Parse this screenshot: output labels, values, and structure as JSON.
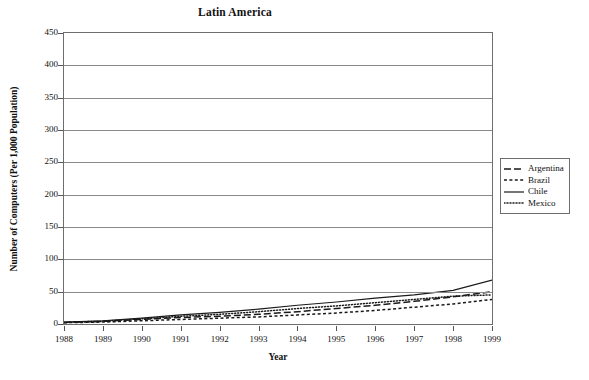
{
  "chart_data": {
    "type": "line",
    "title": "Latin America",
    "xlabel": "Year",
    "ylabel": "Number of Computers (Per 1,000 Population)",
    "categories": [
      1988,
      1989,
      1990,
      1991,
      1992,
      1993,
      1994,
      1995,
      1996,
      1997,
      1998,
      1999
    ],
    "x": [
      "1988",
      "1989",
      "1990",
      "1991",
      "1992",
      "1993",
      "1994",
      "1995",
      "1996",
      "1997",
      "1998",
      "1999"
    ],
    "ylim": [
      0,
      450
    ],
    "yticks": [
      "0",
      "50",
      "100",
      "150",
      "200",
      "250",
      "300",
      "350",
      "400",
      "450"
    ],
    "ytick_values": [
      0,
      50,
      100,
      150,
      200,
      250,
      300,
      350,
      400,
      450
    ],
    "grid": "horizontal",
    "legend_position": "right",
    "series": [
      {
        "name": "Argentina",
        "style": "dashed",
        "color": "#1a1a1a",
        "values": [
          2.5,
          4,
          7,
          10,
          12,
          15,
          19,
          24,
          29,
          35,
          42,
          50
        ]
      },
      {
        "name": "Brazil",
        "style": "short-dashed",
        "color": "#1a1a1a",
        "values": [
          2,
          3,
          5,
          7,
          9,
          11,
          14,
          17,
          21,
          26,
          31,
          38
        ]
      },
      {
        "name": "Chile",
        "style": "solid",
        "color": "#1a1a1a",
        "values": [
          3,
          5,
          9,
          14,
          18,
          23,
          29,
          34,
          40,
          45,
          52,
          68
        ]
      },
      {
        "name": "Mexico",
        "style": "dotted",
        "color": "#1a1a1a",
        "values": [
          2.5,
          4.5,
          8,
          12,
          15,
          19,
          24,
          28,
          33,
          38,
          43,
          45
        ]
      }
    ]
  }
}
